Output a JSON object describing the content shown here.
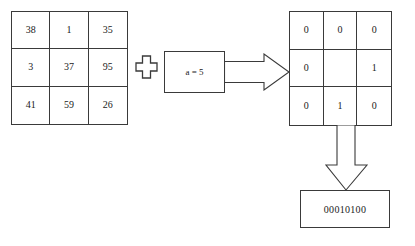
{
  "diagram": {
    "left_matrix": {
      "name": "pixel-value-matrix",
      "rows": [
        [
          "38",
          "1",
          "35"
        ],
        [
          "3",
          "37",
          "95"
        ],
        [
          "41",
          "59",
          "26"
        ]
      ]
    },
    "operator": {
      "symbol": "plus",
      "label": "+"
    },
    "parameter_box": {
      "label": "a = 5"
    },
    "right_matrix": {
      "name": "binary-threshold-matrix",
      "rows": [
        [
          "0",
          "0",
          "0"
        ],
        [
          "0",
          "",
          "1"
        ],
        [
          "0",
          "1",
          "0"
        ]
      ]
    },
    "result_box": {
      "label": "00010100"
    },
    "arrows": {
      "horizontal": "arrow-right",
      "vertical": "arrow-down"
    },
    "colors": {
      "stroke": "#3a3a3a",
      "text": "#1a1a1a",
      "background": "#ffffff"
    }
  }
}
